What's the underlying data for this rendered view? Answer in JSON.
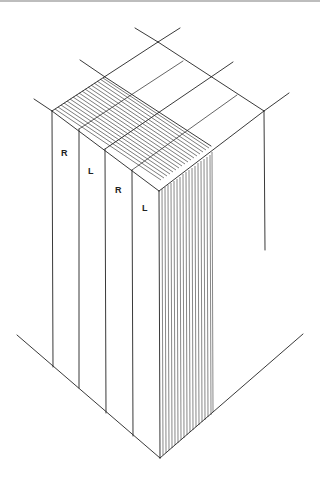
{
  "figure": {
    "type": "isometric block diagram",
    "labels": [
      {
        "text": "R",
        "x": 64,
        "y": 153
      },
      {
        "text": "L",
        "x": 91,
        "y": 171
      },
      {
        "text": "R",
        "x": 118,
        "y": 190
      },
      {
        "text": "L",
        "x": 145,
        "y": 208
      }
    ],
    "colors": {
      "line": "#222222",
      "background": "#ffffff"
    }
  }
}
